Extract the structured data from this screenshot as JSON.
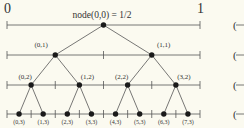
{
  "axis": {
    "left_label": "0",
    "right_label": "1"
  },
  "root_label": "node(0,0) = 1/2",
  "levels": [
    {
      "level": 0,
      "nodes": []
    },
    {
      "level": 1,
      "nodes": [
        "(0,1)",
        "(1,1)"
      ]
    },
    {
      "level": 2,
      "nodes": [
        "(0,2)",
        "(1,2)",
        "(2,2)",
        "(3,2)"
      ]
    },
    {
      "level": 3,
      "nodes": [
        "(0,3)",
        "(1,3)",
        "(2,3)",
        "(3,3)",
        "(4,3)",
        "(5,3)",
        "(6,3)",
        "(7,3)"
      ]
    }
  ],
  "right_marks": [
    "(",
    "(",
    "(",
    "J"
  ],
  "colors": {
    "line": "#555555",
    "node": "#1a1a1a",
    "background": "#fbfaf0"
  }
}
